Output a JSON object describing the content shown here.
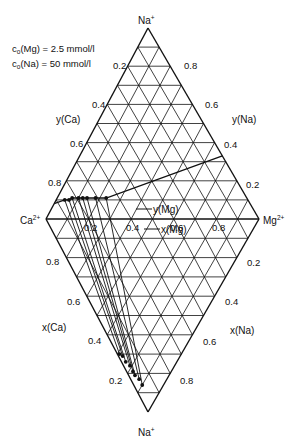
{
  "conditions": {
    "line1_prefix": "c",
    "line1_sub": "o",
    "line1_text": "(Mg)   = 2.5 mmol/l",
    "line2_prefix": "c",
    "line2_sub": "o",
    "line2_text": "(Na) = 50 mmol/l"
  },
  "vertices": {
    "top": {
      "label": "Na",
      "charge": "+"
    },
    "left": {
      "label": "Ca",
      "charge": "2+"
    },
    "right": {
      "label": "Mg",
      "charge": "2+"
    },
    "bottom": {
      "label": "Na",
      "charge": "+"
    }
  },
  "axis_labels": {
    "y_ca": "y(Ca)",
    "y_na": "y(Na)",
    "x_ca": "x(Ca)",
    "x_na": "x(Na)",
    "y_mg": "y(Mg)",
    "x_mg": "x(Mg)",
    "y_mg_arrow": "→",
    "x_mg_arrow": "←"
  },
  "ticks": {
    "upper_left": [
      "0.2",
      "0.4",
      "0.6",
      "0.8"
    ],
    "upper_right": [
      "0.8",
      "0.6",
      "0.4",
      "0.2"
    ],
    "lower_left": [
      "0.8",
      "0.6",
      "0.4",
      "0.2"
    ],
    "lower_right": [
      "0.2",
      "0.4",
      "0.6",
      "0.8"
    ],
    "middle": [
      "0.2",
      "0.4",
      "0.6",
      "0.8"
    ]
  },
  "chart_data": {
    "type": "scatter",
    "grid_divisions": 10,
    "upper_points_y": [
      {
        "y_Ca": 0.86,
        "y_Mg": 0.04,
        "y_Na": 0.1
      },
      {
        "y_Ca": 0.84,
        "y_Mg": 0.06,
        "y_Na": 0.1
      },
      {
        "y_Ca": 0.82,
        "y_Mg": 0.07,
        "y_Na": 0.11
      },
      {
        "y_Ca": 0.79,
        "y_Mg": 0.1,
        "y_Na": 0.11
      },
      {
        "y_Ca": 0.77,
        "y_Mg": 0.12,
        "y_Na": 0.11
      },
      {
        "y_Ca": 0.75,
        "y_Mg": 0.14,
        "y_Na": 0.11
      },
      {
        "y_Ca": 0.71,
        "y_Mg": 0.18,
        "y_Na": 0.11
      },
      {
        "y_Ca": 0.66,
        "y_Mg": 0.23,
        "y_Na": 0.11
      }
    ],
    "lower_points_x": [
      {
        "x_Ca": 0.29,
        "x_Mg": 0.01,
        "x_Na": 0.7
      },
      {
        "x_Ca": 0.27,
        "x_Mg": 0.02,
        "x_Na": 0.71
      },
      {
        "x_Ca": 0.24,
        "x_Mg": 0.02,
        "x_Na": 0.74
      },
      {
        "x_Ca": 0.21,
        "x_Mg": 0.03,
        "x_Na": 0.76
      },
      {
        "x_Ca": 0.18,
        "x_Mg": 0.03,
        "x_Na": 0.79
      },
      {
        "x_Ca": 0.16,
        "x_Mg": 0.03,
        "x_Na": 0.81
      },
      {
        "x_Ca": 0.13,
        "x_Mg": 0.04,
        "x_Na": 0.83
      },
      {
        "x_Ca": 0.1,
        "x_Mg": 0.04,
        "x_Na": 0.86
      }
    ],
    "curve": "smooth line through upper points extending toward right edge at y_Na≈0.33",
    "curve_end": {
      "y_Ca": 0.0,
      "y_Mg": 0.67,
      "y_Na": 0.33
    }
  }
}
